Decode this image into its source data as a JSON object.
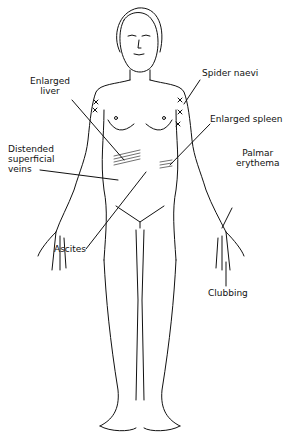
{
  "diagram": {
    "labels": {
      "enlarged_liver": "Enlarged\nliver",
      "spider_naevi": "Spider naevi",
      "enlarged_spleen": "Enlarged spleen",
      "distended_veins": "Distended\nsuperficial\nveins",
      "palmar_erythema": "Palmar\nerythema",
      "ascites": "Ascites",
      "clubbing": "Clubbing"
    },
    "colors": {
      "line": "#111111",
      "background": "#ffffff"
    }
  }
}
